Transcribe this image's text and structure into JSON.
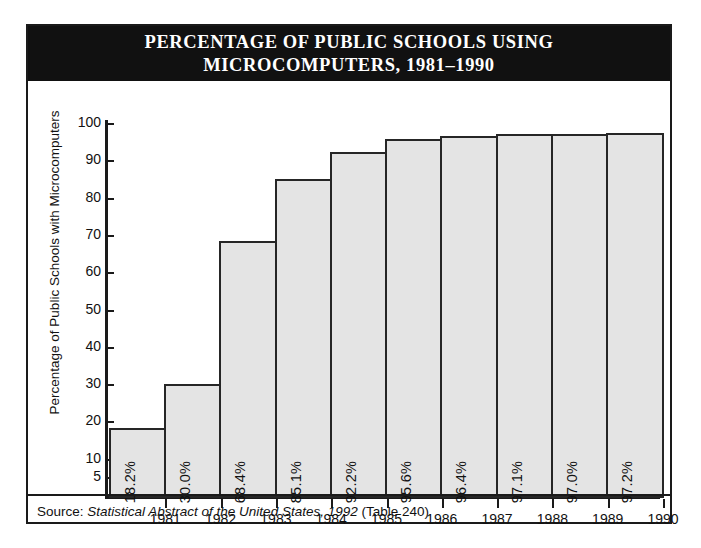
{
  "figure": {
    "title_line1": "PERCENTAGE OF PUBLIC SCHOOLS USING",
    "title_line2": "MICROCOMPUTERS, 1981–1990",
    "source_prefix": "Source:",
    "source_italic": "Statistical Abstract of the United States, 1992",
    "source_suffix": "(Table 240)",
    "colors": {
      "title_bar_bg": "#111111",
      "title_text": "#ffffff",
      "bar_fill": "#e4e4e4",
      "bar_stroke": "#262626",
      "axis": "#1a1a1a",
      "frame": "#1a1a1a",
      "text": "#111111"
    }
  },
  "chart_data": {
    "type": "bar",
    "title": "PERCENTAGE OF PUBLIC SCHOOLS USING MICROCOMPUTERS, 1981–1990",
    "xlabel": "",
    "ylabel": "Percentage of Public Schools with Microcomputers",
    "categories": [
      "1981",
      "1982",
      "1983",
      "1984",
      "1985",
      "1986",
      "1987",
      "1988",
      "1989",
      "1990"
    ],
    "values": [
      18.2,
      30.0,
      68.4,
      85.1,
      92.2,
      95.6,
      96.4,
      97.1,
      97.0,
      97.2
    ],
    "value_labels": [
      "18.2%",
      "30.0%",
      "68.4%",
      "85.1%",
      "92.2%",
      "95.6%",
      "96.4%",
      "97.1%",
      "97.0%",
      "97.2%"
    ],
    "ylim": [
      0,
      100
    ],
    "yticks": [
      5,
      10,
      20,
      30,
      40,
      50,
      60,
      70,
      80,
      90,
      100
    ],
    "ytick_labels": [
      "5",
      "10",
      "20",
      "30",
      "40",
      "50",
      "60",
      "70",
      "80",
      "90",
      "100"
    ],
    "grid": false,
    "legend": false
  }
}
